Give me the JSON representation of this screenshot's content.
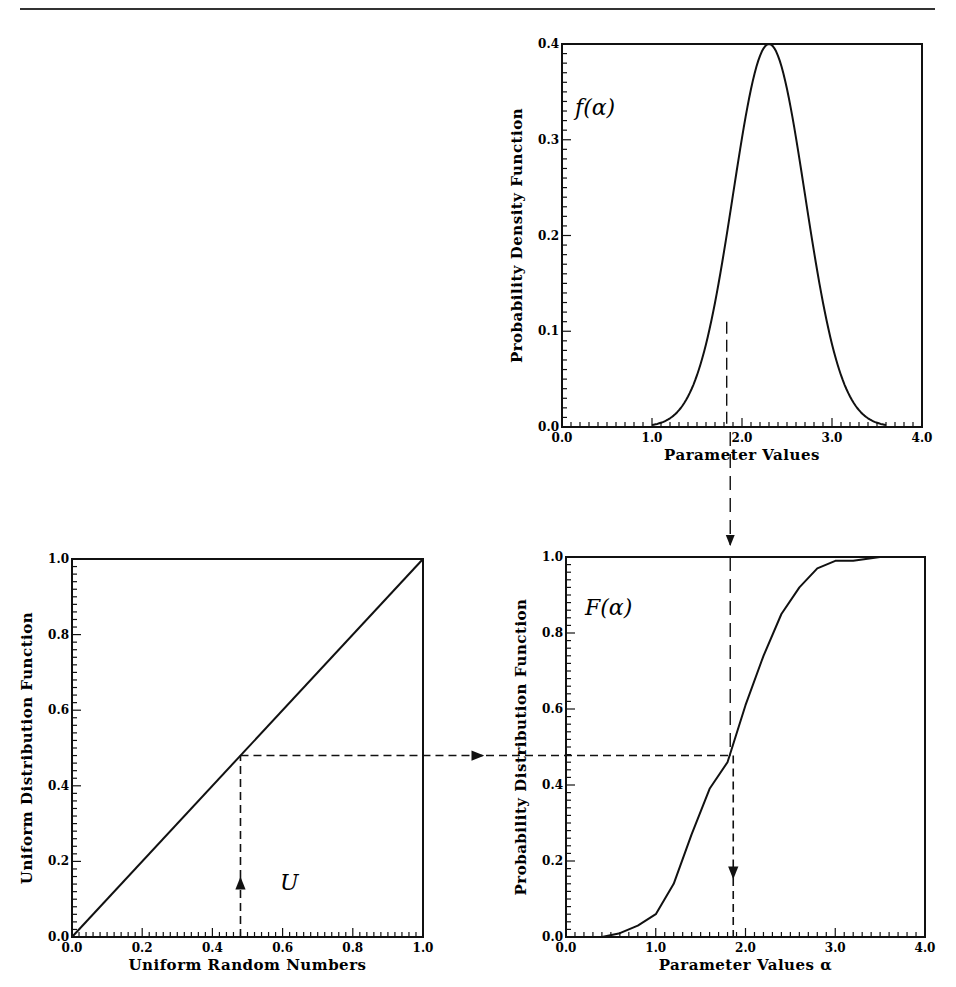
{
  "chart_data": [
    {
      "id": "pdf",
      "type": "line",
      "title": "",
      "annotation": "f(α)",
      "xlabel": "Parameter Values",
      "ylabel": "Probability Density Function",
      "xlim": [
        0.0,
        4.0
      ],
      "ylim": [
        0.0,
        0.4
      ],
      "xticks": [
        "0.0",
        "1.0",
        "2.0",
        "3.0",
        "4.0"
      ],
      "yticks": [
        "0.0",
        "0.1",
        "0.2",
        "0.3",
        "0.4"
      ],
      "grid": false,
      "series": [
        {
          "name": "f(alpha)",
          "distribution": "normal",
          "mean": 2.3,
          "std": 0.4,
          "x": [
            1.2,
            1.4,
            1.6,
            1.8,
            1.9,
            2.0,
            2.1,
            2.2,
            2.3,
            2.4,
            2.5,
            2.6,
            2.7,
            2.8,
            3.0,
            3.2,
            3.4
          ],
          "y": [
            0.0,
            0.01,
            0.08,
            0.19,
            0.25,
            0.3,
            0.35,
            0.39,
            0.4,
            0.39,
            0.35,
            0.3,
            0.25,
            0.19,
            0.08,
            0.02,
            0.0
          ]
        }
      ],
      "dashed_guide": {
        "x": 1.83,
        "from_y": 0.0,
        "to_y": 0.11
      }
    },
    {
      "id": "uniform-cdf",
      "type": "line",
      "title": "",
      "annotation": "U",
      "xlabel": "Uniform Random Numbers",
      "ylabel": "Uniform Distribution Function",
      "xlim": [
        0.0,
        1.0
      ],
      "ylim": [
        0.0,
        1.0
      ],
      "xticks": [
        "0.0",
        "0.2",
        "0.4",
        "0.6",
        "0.8",
        "1.0"
      ],
      "yticks": [
        "0.0",
        "0.2",
        "0.4",
        "0.6",
        "0.8",
        "1.0"
      ],
      "grid": false,
      "series": [
        {
          "name": "U(u)",
          "x": [
            0.0,
            1.0
          ],
          "y": [
            0.0,
            1.0
          ]
        }
      ],
      "dashed_guide": {
        "u": 0.48,
        "arrow": "up"
      }
    },
    {
      "id": "cdf",
      "type": "line",
      "title": "",
      "annotation": "F(α)",
      "xlabel": "Parameter Values α",
      "ylabel": "Probability Distribution Function",
      "xlim": [
        0.0,
        4.0
      ],
      "ylim": [
        0.0,
        1.0
      ],
      "xticks": [
        "0.0",
        "1.0",
        "2.0",
        "3.0",
        "4.0"
      ],
      "yticks": [
        "0.0",
        "0.2",
        "0.4",
        "0.6",
        "0.8",
        "1.0"
      ],
      "grid": false,
      "series": [
        {
          "name": "F(alpha)",
          "x": [
            0.0,
            0.4,
            0.6,
            0.8,
            1.0,
            1.2,
            1.4,
            1.6,
            1.8,
            2.0,
            2.2,
            2.4,
            2.6,
            2.8,
            3.0,
            3.2,
            3.5,
            4.0
          ],
          "y": [
            0.0,
            0.0,
            0.01,
            0.03,
            0.06,
            0.14,
            0.27,
            0.39,
            0.46,
            0.61,
            0.74,
            0.85,
            0.92,
            0.97,
            0.99,
            0.99,
            1.0,
            1.0
          ]
        }
      ],
      "dashed_guide": {
        "alpha": 1.83,
        "F": 0.48,
        "arrow": "down"
      }
    }
  ]
}
